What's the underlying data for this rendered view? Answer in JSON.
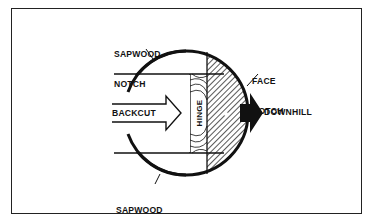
{
  "diagram": {
    "labels": {
      "sapwood_notch_top": [
        "SAPWOOD",
        "NOTCH"
      ],
      "sapwood_notch_bottom": [
        "SAPWOOD",
        "NOTCH"
      ],
      "face_notch": [
        "FACE",
        "NOTCH"
      ],
      "backcut": "BACKCUT",
      "hinge": "HINGE",
      "downhill": "DOWNHILL"
    },
    "colors": {
      "line": "#111111",
      "background": "#ffffff",
      "arrow_fill": "#111111"
    }
  }
}
